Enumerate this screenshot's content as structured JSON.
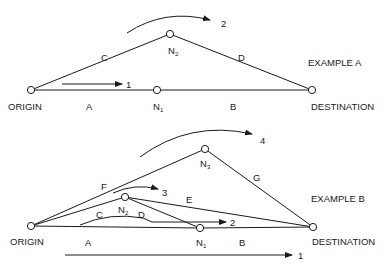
{
  "colors": {
    "ink": "#1a1a1a",
    "background": "#ffffff"
  },
  "example_a": {
    "title": "EXAMPLE A",
    "nodes": {
      "origin": {
        "label": "ORIGIN"
      },
      "n1": {
        "label": "N",
        "sub": "1"
      },
      "n2": {
        "label": "N",
        "sub": "2"
      },
      "destination": {
        "label": "DESTINATION"
      }
    },
    "links": [
      {
        "id": "A",
        "from": "origin",
        "to": "n1"
      },
      {
        "id": "B",
        "from": "n1",
        "to": "destination"
      },
      {
        "id": "C",
        "from": "origin",
        "to": "n2"
      },
      {
        "id": "D",
        "from": "n2",
        "to": "destination"
      }
    ],
    "flows": [
      {
        "id": "1",
        "path": [
          "A",
          "B"
        ]
      },
      {
        "id": "2",
        "path": [
          "C",
          "D"
        ]
      }
    ]
  },
  "example_b": {
    "title": "EXAMPLE B",
    "nodes": {
      "origin": {
        "label": "ORIGIN"
      },
      "n1": {
        "label": "N",
        "sub": "1"
      },
      "n2": {
        "label": "N",
        "sub": "2"
      },
      "n3": {
        "label": "N",
        "sub": "3"
      },
      "destination": {
        "label": "DESTINATION"
      }
    },
    "links": [
      {
        "id": "A",
        "from": "origin",
        "to": "n1"
      },
      {
        "id": "B",
        "from": "n1",
        "to": "destination"
      },
      {
        "id": "C",
        "from": "origin",
        "to": "n2"
      },
      {
        "id": "D",
        "from": "n2",
        "to": "n1"
      },
      {
        "id": "E",
        "from": "n2",
        "to": "destination"
      },
      {
        "id": "F",
        "from": "origin",
        "to": "n3"
      },
      {
        "id": "G",
        "from": "n3",
        "to": "destination"
      }
    ],
    "flows": [
      {
        "id": "1",
        "path": [
          "A",
          "B"
        ]
      },
      {
        "id": "2",
        "path": [
          "C",
          "D",
          "B"
        ]
      },
      {
        "id": "3",
        "path": [
          "C",
          "E"
        ]
      },
      {
        "id": "4",
        "path": [
          "F",
          "G"
        ]
      }
    ]
  }
}
